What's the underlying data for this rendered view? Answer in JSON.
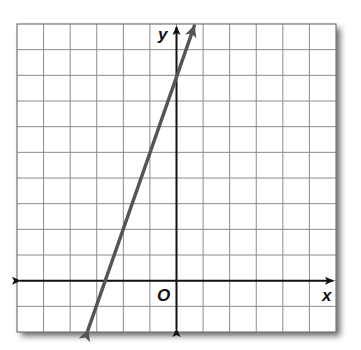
{
  "chart_data": {
    "type": "line",
    "title": "",
    "xlabel": "x",
    "ylabel": "y",
    "origin_label": "O",
    "xlim": [
      -6,
      6
    ],
    "ylim": [
      -2,
      10
    ],
    "grid": true,
    "tick_labels_shown": false,
    "series": [
      {
        "name": "line",
        "equation": "y = 3x + 8",
        "slope": 3,
        "y_intercept": 8,
        "x_intercept": -2.67,
        "x": [
          -3.33,
          0.67
        ],
        "y": [
          -2,
          10
        ],
        "arrows_both_ends": true,
        "color": "#555555"
      }
    ]
  },
  "colors": {
    "grid": "#8a8a8a",
    "axes": "#111111",
    "line": "#555555",
    "shadow": "#9a9a9a"
  },
  "labels": {
    "x_axis": "x",
    "y_axis": "y",
    "origin": "O"
  }
}
